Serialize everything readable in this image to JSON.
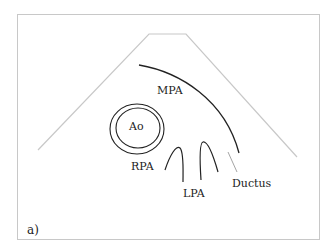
{
  "figure": {
    "panel_label": "a)",
    "labels": {
      "mpa": "MPA",
      "ao": "Ao",
      "rpa": "RPA",
      "lpa": "LPA",
      "ductus": "Ductus"
    },
    "colors": {
      "outline": "#c8c8c8",
      "stroke": "#222222",
      "ductus_line": "#9a9a9a"
    }
  }
}
